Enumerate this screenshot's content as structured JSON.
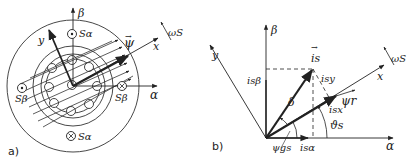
{
  "panel_a": {
    "label": "a)",
    "axes": {
      "alpha": "α",
      "beta": "β",
      "x": "x",
      "y": "y"
    },
    "vector": "ψ",
    "vector_arrow": "→",
    "speed": "ωS",
    "coils": {
      "s_alpha_top": "Sα",
      "s_alpha_bottom": "Sα",
      "s_beta_left": "Sβ",
      "s_beta_right": "Sβ"
    }
  },
  "panel_b": {
    "label": "b)",
    "axes": {
      "alpha": "α",
      "beta": "β",
      "x": "x",
      "y": "y"
    },
    "current_vector": "is",
    "vector_arrow": "→",
    "components": {
      "i_s_beta": "isβ",
      "i_s_alpha": "isα",
      "i_sx": "isx",
      "i_sy": "isy"
    },
    "flux": "ψr",
    "angles": {
      "delta": "δ",
      "theta_s": "ϑs",
      "psi_gs": "ψgs"
    },
    "speed": "ωS"
  }
}
